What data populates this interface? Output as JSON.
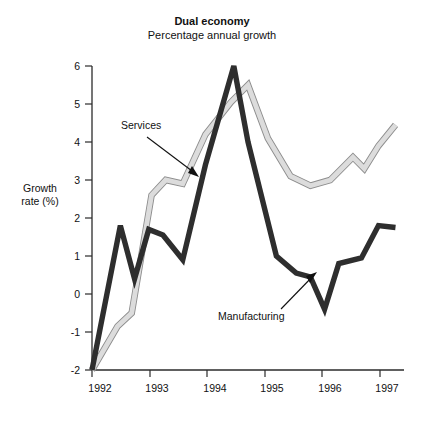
{
  "chart_data": {
    "type": "line",
    "title": "Dual economy",
    "subtitle": "Percentage annual growth",
    "xlabel": "",
    "ylabel": "Growth rate (%)",
    "xlim": [
      1992.0,
      1997.5
    ],
    "ylim": [
      -2,
      6
    ],
    "yticks": [
      -2,
      -1,
      0,
      1,
      2,
      3,
      4,
      5,
      6
    ],
    "ytick_labels": [
      "-2",
      "-1",
      "0",
      "1",
      "2",
      "3",
      "4",
      "5",
      "6"
    ],
    "xticks": [
      1992,
      1993,
      1994,
      1995,
      1996,
      1997
    ],
    "xtick_labels": [
      "1992",
      "1993",
      "1994",
      "1995",
      "1996",
      "1997"
    ],
    "grid": false,
    "legend": "annotations",
    "annotations": [
      {
        "text": "Services",
        "points_to": "light-line",
        "series": "Services"
      },
      {
        "text": "Manufacturing",
        "points_to": "dark-line",
        "series": "Manufacturing"
      }
    ],
    "series": [
      {
        "name": "Manufacturing",
        "style": "thick-dark",
        "color": "#2e2e2e",
        "x": [
          1992.0,
          1992.5,
          1992.75,
          1993.0,
          1993.25,
          1993.6,
          1994.0,
          1994.5,
          1994.75,
          1995.25,
          1995.6,
          1995.85,
          1996.1,
          1996.35,
          1996.75,
          1997.05,
          1997.35
        ],
        "y": [
          -2.0,
          1.8,
          0.4,
          1.7,
          1.55,
          0.9,
          3.4,
          6.0,
          4.0,
          1.0,
          0.55,
          0.45,
          -0.4,
          0.8,
          0.95,
          1.8,
          1.75
        ]
      },
      {
        "name": "Services",
        "style": "thick-light-outlined",
        "color": "#dcdcdc",
        "edge_color": "#8d8d8d",
        "x": [
          1992.0,
          1992.45,
          1992.7,
          1993.05,
          1993.3,
          1993.6,
          1994.0,
          1994.45,
          1994.75,
          1995.1,
          1995.5,
          1995.85,
          1996.2,
          1996.6,
          1996.8,
          1997.05,
          1997.35
        ],
        "y": [
          -2.0,
          -0.85,
          -0.5,
          2.6,
          3.0,
          2.9,
          4.2,
          5.05,
          5.5,
          4.1,
          3.1,
          2.85,
          3.0,
          3.6,
          3.3,
          3.9,
          4.45
        ]
      }
    ]
  }
}
